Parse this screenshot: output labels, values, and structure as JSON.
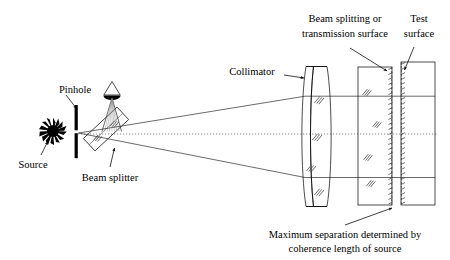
{
  "figure": {
    "kind": "optical-interferometer-schematic",
    "width": 450,
    "height": 260,
    "background_color": "#ffffff",
    "line_color": "#000000",
    "ray_color": "#2b2b2b",
    "axis_color": "#555555"
  },
  "labels": {
    "pinhole": "Pinhole",
    "source": "Source",
    "beam_splitter": "Beam splitter",
    "collimator": "Collimator",
    "beam_splitting_line1": "Beam splitting or",
    "beam_splitting_line2": "transmission surface",
    "test_surface_line1": "Test",
    "test_surface_line2": "surface",
    "max_separation_line1": "Maximum separation determined by",
    "max_separation_line2": "coherence length of source"
  },
  "components": {
    "source": {
      "name": "source-starburst",
      "cx": 53,
      "cy": 131,
      "core_r": 6.2,
      "ray_count": 16,
      "ray_len": 7.5
    },
    "pinhole": {
      "name": "pinhole-aperture",
      "x": 76,
      "y_top": 105,
      "y_bot": 158,
      "thickness": 3.2,
      "gap_y": 131,
      "gap_h": 3
    },
    "beam_splitter": {
      "name": "beam-splitter-plate",
      "cx": 106,
      "cy": 129,
      "w": 46,
      "h": 17,
      "angle_deg": -43
    },
    "eye": {
      "name": "observer-eye",
      "cx": 112,
      "cy": 89,
      "tri_w": 17,
      "tri_h": 13
    },
    "collimator": {
      "name": "collimator-doublet-lens",
      "x_left": 302,
      "x_right": 333,
      "y_top": 66,
      "y_bot": 207
    },
    "beam_splitter_plate": {
      "name": "beam-splitting-plate",
      "x": 358,
      "y": 67,
      "w": 34,
      "h": 138
    },
    "test_plate": {
      "name": "test-surface-plate",
      "x": 401,
      "y": 62,
      "w": 34,
      "h": 143
    }
  },
  "optical_axis": {
    "y": 134,
    "x_start": 78,
    "x_end": 437
  },
  "rays": {
    "upper_fan_y_at_lens": 96,
    "lower_fan_y_at_lens": 177,
    "origin_x": 78,
    "origin_y": 133
  }
}
